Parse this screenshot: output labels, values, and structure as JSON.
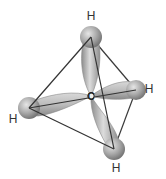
{
  "molecule": {
    "name": "methane",
    "center_atom": {
      "label": "C",
      "x": 91,
      "y": 96
    },
    "hydrogens": [
      {
        "id": "top",
        "label": "H",
        "x": 91,
        "y": 37,
        "label_x": 91,
        "label_y": 20
      },
      {
        "id": "right",
        "label": "H",
        "x": 136,
        "y": 90,
        "label_x": 149,
        "label_y": 93
      },
      {
        "id": "left",
        "label": "H",
        "x": 29,
        "y": 108,
        "label_x": 13,
        "label_y": 123
      },
      {
        "id": "bottom",
        "label": "H",
        "x": 114,
        "y": 149,
        "label_x": 116,
        "label_y": 172
      }
    ],
    "colors": {
      "lobe": "#b8b8b8",
      "sphere": "#a6a6a6",
      "edge": "#333333"
    }
  }
}
